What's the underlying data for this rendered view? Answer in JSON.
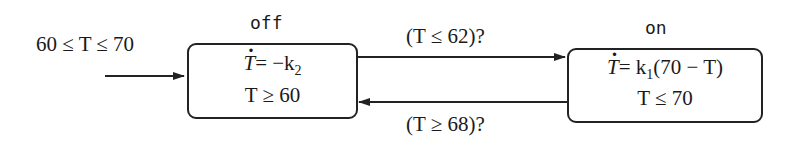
{
  "diagram": {
    "type": "hybrid-automaton",
    "initial_condition": "60 ≤ T ≤ 70",
    "states": [
      {
        "name": "off",
        "flow": {
          "lhs": "T",
          "rhs": "= −k",
          "sub": "2"
        },
        "invariant": "T ≥ 60"
      },
      {
        "name": "on",
        "flow": {
          "lhs": "T",
          "rhs_a": "= k",
          "sub": "1",
          "rhs_b": "(70 − T)"
        },
        "invariant": "T ≤ 70"
      }
    ],
    "transitions": [
      {
        "from": "off",
        "to": "on",
        "guard": "(T ≤ 62)?"
      },
      {
        "from": "on",
        "to": "off",
        "guard": "(T ≥ 68)?"
      }
    ],
    "colors": {
      "stroke": "#222222",
      "background": "#ffffff"
    }
  }
}
